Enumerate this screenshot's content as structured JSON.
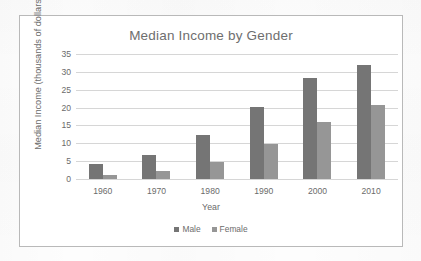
{
  "chart_data": {
    "type": "bar",
    "title": "Median Income by Gender",
    "xlabel": "Year",
    "ylabel": "Median Income (thousands of dollars)",
    "categories": [
      "1960",
      "1970",
      "1980",
      "1990",
      "2000",
      "2010"
    ],
    "series": [
      {
        "name": "Male",
        "color": "#757575",
        "values": [
          4.1,
          6.6,
          12.3,
          20.3,
          28.2,
          32.0
        ]
      },
      {
        "name": "Female",
        "color": "#969696",
        "values": [
          1.2,
          2.2,
          4.9,
          9.9,
          16.0,
          20.6
        ]
      }
    ],
    "ylim": [
      0,
      35
    ],
    "yticks": [
      "0",
      "5",
      "10",
      "15",
      "20",
      "25",
      "30",
      "35"
    ],
    "grid": true,
    "legend_position": "bottom"
  }
}
